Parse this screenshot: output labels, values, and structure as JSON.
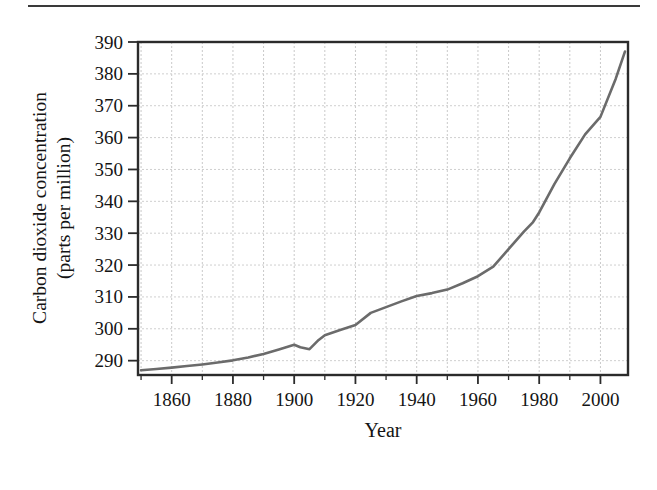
{
  "figure": {
    "background_color": "#ffffff",
    "rule_color": "#3a3a3a"
  },
  "chart_data": {
    "type": "line",
    "title": "",
    "xlabel": "Year",
    "ylabel": "Carbon dioxide concentration (parts per million)",
    "ylabel_line1": "Carbon dioxide concentration",
    "ylabel_line2": "(parts per million)",
    "xlim": [
      1849,
      2009
    ],
    "ylim": [
      285.5,
      390
    ],
    "xticks": [
      1860,
      1880,
      1900,
      1920,
      1940,
      1960,
      1980,
      2000
    ],
    "xtick_labels": [
      "1860",
      "1880",
      "1900",
      "1920",
      "1940",
      "1960",
      "1980",
      "2000"
    ],
    "xminor_step": 10,
    "yticks": [
      290,
      300,
      310,
      320,
      330,
      340,
      350,
      360,
      370,
      380,
      390
    ],
    "ytick_labels": [
      "290",
      "300",
      "310",
      "320",
      "330",
      "340",
      "350",
      "360",
      "370",
      "380",
      "390"
    ],
    "grid": true,
    "grid_style": "dotted",
    "grid_color": "#c8c8c8",
    "legend": "none",
    "line_color": "#6b6b6b",
    "line_width": 2.6,
    "axis_color": "#2b2b2b",
    "series": [
      {
        "name": "Carbon dioxide concentration",
        "x": [
          1850,
          1855,
          1860,
          1865,
          1870,
          1875,
          1880,
          1885,
          1890,
          1895,
          1900,
          1902,
          1905,
          1908,
          1910,
          1915,
          1920,
          1925,
          1930,
          1935,
          1940,
          1945,
          1950,
          1955,
          1960,
          1965,
          1970,
          1975,
          1978,
          1980,
          1985,
          1990,
          1995,
          2000,
          2005,
          2008
        ],
        "y": [
          287.0,
          287.4,
          287.8,
          288.3,
          288.8,
          289.4,
          290.1,
          291.0,
          292.1,
          293.5,
          295.0,
          294.2,
          293.6,
          296.5,
          298.0,
          299.6,
          301.2,
          305.0,
          306.8,
          308.6,
          310.3,
          311.2,
          312.3,
          314.3,
          316.5,
          319.5,
          325.0,
          330.5,
          333.5,
          336.5,
          345.5,
          353.5,
          361.0,
          366.5,
          378.5,
          387.0
        ]
      }
    ]
  }
}
